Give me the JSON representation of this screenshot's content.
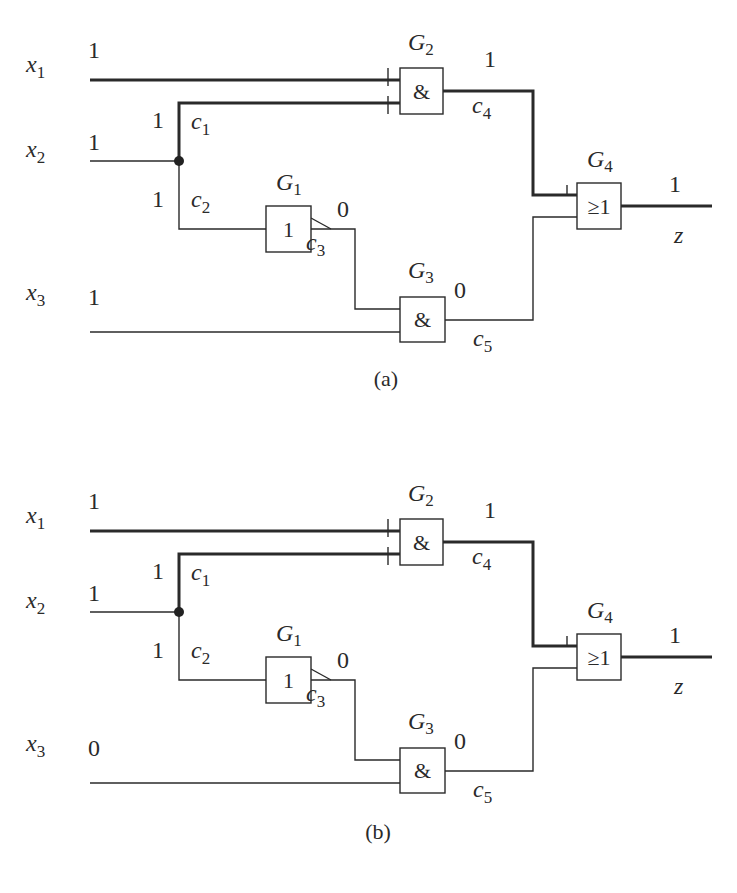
{
  "diagrams": [
    {
      "id": "a",
      "caption": "(a)",
      "offset_y": 0,
      "inputs": {
        "x1": {
          "name": "x",
          "sub": "1",
          "value": "1"
        },
        "x2": {
          "name": "x",
          "sub": "2",
          "value": "1"
        },
        "x3": {
          "name": "x",
          "sub": "3",
          "value": "1"
        }
      },
      "branches": {
        "c1": {
          "name": "c",
          "sub": "1",
          "value": "1"
        },
        "c2": {
          "name": "c",
          "sub": "2",
          "value": "1"
        },
        "c3": {
          "name": "c",
          "sub": "3",
          "value": "0"
        },
        "c4": {
          "name": "c",
          "sub": "4",
          "value": "1"
        },
        "c5": {
          "name": "c",
          "sub": "5",
          "value": "0"
        }
      },
      "gates": {
        "G1": {
          "name": "G",
          "sub": "1",
          "symbol": "1",
          "type": "NOT"
        },
        "G2": {
          "name": "G",
          "sub": "2",
          "symbol": "&",
          "type": "AND"
        },
        "G3": {
          "name": "G",
          "sub": "3",
          "symbol": "&",
          "type": "AND"
        },
        "G4": {
          "name": "G",
          "sub": "4",
          "symbol": "≥1",
          "type": "OR"
        }
      },
      "output": {
        "name": "z",
        "value": "1"
      }
    },
    {
      "id": "b",
      "caption": "(b)",
      "offset_y": 451,
      "inputs": {
        "x1": {
          "name": "x",
          "sub": "1",
          "value": "1"
        },
        "x2": {
          "name": "x",
          "sub": "2",
          "value": "1"
        },
        "x3": {
          "name": "x",
          "sub": "3",
          "value": "0"
        }
      },
      "branches": {
        "c1": {
          "name": "c",
          "sub": "1",
          "value": "1"
        },
        "c2": {
          "name": "c",
          "sub": "2",
          "value": "1"
        },
        "c3": {
          "name": "c",
          "sub": "3",
          "value": "0"
        },
        "c4": {
          "name": "c",
          "sub": "4",
          "value": "1"
        },
        "c5": {
          "name": "c",
          "sub": "5",
          "value": "0"
        }
      },
      "gates": {
        "G1": {
          "name": "G",
          "sub": "1",
          "symbol": "1",
          "type": "NOT"
        },
        "G2": {
          "name": "G",
          "sub": "2",
          "symbol": "&",
          "type": "AND"
        },
        "G3": {
          "name": "G",
          "sub": "3",
          "symbol": "&",
          "type": "AND"
        },
        "G4": {
          "name": "G",
          "sub": "4",
          "symbol": "≥1",
          "type": "OR"
        }
      },
      "output": {
        "name": "z",
        "value": "1"
      }
    }
  ]
}
